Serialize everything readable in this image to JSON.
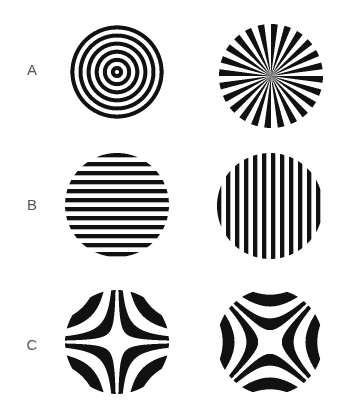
{
  "figure": {
    "background": "#ffffff",
    "ink": "#111111",
    "label_color": "#555555",
    "rows": [
      {
        "label": "A",
        "label_pos": [
          32,
          70
        ],
        "panels": [
          {
            "name": "concentric-rings",
            "pattern": "concentric",
            "center": [
              117,
              72
            ],
            "radius": 49,
            "period": 8.1
          },
          {
            "name": "radial-star",
            "pattern": "radial",
            "center": [
              271,
              76
            ],
            "radius": 52,
            "black_wedges": 24
          }
        ]
      },
      {
        "label": "B",
        "label_pos": [
          32,
          205
        ],
        "panels": [
          {
            "name": "horizontal-grating",
            "pattern": "horizontal",
            "center": [
              117,
              205
            ],
            "radius": 52,
            "period": 9,
            "stripe_count": 12
          },
          {
            "name": "vertical-grating",
            "pattern": "vertical",
            "center": [
              270,
              206
            ],
            "radius": 53,
            "period": 9,
            "stripe_count": 12
          }
        ]
      },
      {
        "label": "C",
        "label_pos": [
          32,
          345
        ],
        "panels": [
          {
            "name": "hyperbolic-xy",
            "pattern": "hyperbolic_xy",
            "center": [
              117,
              342
            ],
            "radius": 52,
            "period": 300
          },
          {
            "name": "hyperbolic-diagonal",
            "pattern": "hyperbolic_x2y2",
            "center": [
              270,
              342
            ],
            "radius": 53,
            "period": 560
          }
        ]
      }
    ]
  }
}
